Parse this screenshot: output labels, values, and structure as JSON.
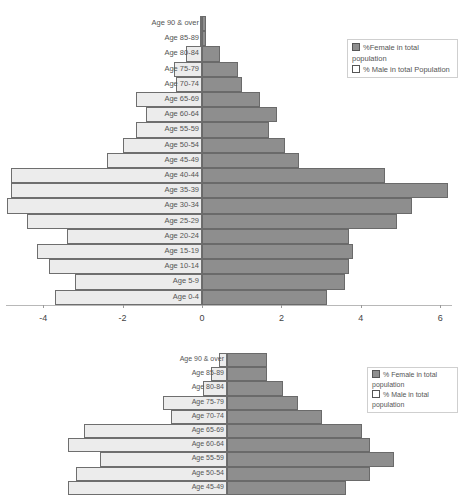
{
  "chart_data": [
    {
      "type": "bar",
      "orientation": "horizontal",
      "title": "",
      "xlabel": "",
      "ylabel": "",
      "categories": [
        "Age 90 & over",
        "Age 85-89",
        "Age 80-84",
        "Age 75-79",
        "Age 70-74",
        "Age 65-69",
        "Age 60-64",
        "Age 55-59",
        "Age 50-54",
        "Age 45-49",
        "Age 40-44",
        "Age 35-39",
        "Age 30-34",
        "Age 25-29",
        "Age 20-24",
        "Age 15-19",
        "Age 10-14",
        "Age 5-9",
        "Age 0-4"
      ],
      "series": [
        {
          "name": "%Female in total population",
          "color": "#8e8e8e",
          "values": [
            0.1,
            0.1,
            0.45,
            0.9,
            1.0,
            1.45,
            1.9,
            1.7,
            2.1,
            2.45,
            4.6,
            6.2,
            5.3,
            4.9,
            3.7,
            3.8,
            3.7,
            3.6,
            3.15
          ]
        },
        {
          "name": "% Male in total Population",
          "color": "#ececec",
          "values": [
            -0.05,
            -0.05,
            -0.4,
            -0.7,
            -0.65,
            -1.65,
            -1.4,
            -1.65,
            -2.0,
            -2.4,
            -4.8,
            -4.8,
            -4.9,
            -4.4,
            -3.4,
            -4.15,
            -3.85,
            -3.2,
            -3.7
          ]
        }
      ],
      "xticks": [
        "-4",
        "-2",
        "0",
        "2",
        "4",
        "6"
      ],
      "xlim": [
        -5,
        6.3
      ],
      "grid": false,
      "legend_position": "upper right"
    },
    {
      "type": "bar",
      "orientation": "horizontal",
      "partial": true,
      "title": "",
      "categories": [
        "Age 90 & over",
        "Age 85-89",
        "Age 80-84",
        "Age 75-79",
        "Age 70-74",
        "Age 65-69",
        "Age 60-64",
        "Age 55-59",
        "Age 50-54",
        "Age 45-49"
      ],
      "series": [
        {
          "name": "% Female in total population",
          "color": "#8e8e8e",
          "values": [
            1.0,
            1.0,
            1.4,
            1.8,
            2.4,
            3.4,
            3.6,
            4.2,
            3.6,
            3.0
          ]
        },
        {
          "name": "% Male in total population",
          "color": "#ececec",
          "values": [
            -0.2,
            -0.4,
            -0.6,
            -1.6,
            -1.4,
            -3.6,
            -4.0,
            -3.2,
            -3.8,
            -4.0
          ]
        }
      ],
      "legend_position": "upper right"
    }
  ],
  "chart1": {
    "legend": {
      "female": "%Female in total population",
      "male": "% Male in total Population"
    },
    "ticks": [
      "-4",
      "-2",
      "0",
      "2",
      "4",
      "6"
    ]
  },
  "chart2": {
    "legend": {
      "female": "% Female in total population",
      "male": "% Male in total population"
    }
  }
}
